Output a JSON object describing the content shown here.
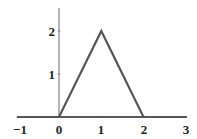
{
  "chart_data": {
    "type": "line",
    "title": "",
    "xlabel": "",
    "ylabel": "",
    "x": [
      -1,
      0,
      1,
      2,
      3
    ],
    "series": [
      {
        "name": "triangle",
        "values": [
          0,
          0,
          2,
          0,
          0
        ],
        "color": "#555555"
      }
    ],
    "xlim": [
      -1,
      3
    ],
    "ylim": [
      0,
      2.5
    ],
    "xticks": [
      "−1",
      "0",
      "1",
      "2",
      "3"
    ],
    "yticks": [
      "1",
      "2"
    ],
    "grid": false,
    "legend": "none"
  },
  "labels": {
    "xticks": [
      "−1",
      "0",
      "1",
      "2",
      "3"
    ],
    "yticks": [
      "1",
      "2"
    ]
  }
}
